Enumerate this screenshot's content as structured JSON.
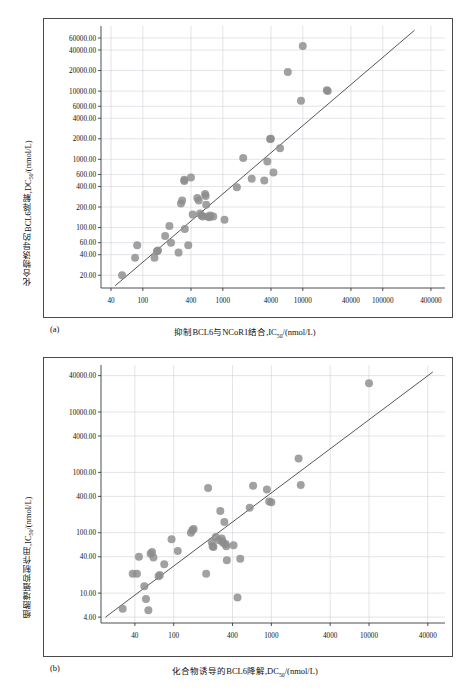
{
  "figure": {
    "panels": [
      {
        "tag": "(a)",
        "xlabel_pre": "抑制BCL6与NCoR1结合,IC",
        "xlabel_sub": "50",
        "xlabel_post": "/(nmol/L)",
        "ylabel_pre": "化合物诱导的BCL6降解,DC",
        "ylabel_sub": "50",
        "ylabel_post": "/(nmol/L)"
      },
      {
        "tag": "(b)",
        "xlabel_pre": "化合物诱导的BCL6降解,DC",
        "xlabel_sub": "50",
        "xlabel_post": "/(nmol/L)",
        "ylabel_pre": "细胞增殖抑制作用,IC",
        "ylabel_sub": "50",
        "ylabel_post": "/(nmol/L)"
      }
    ]
  },
  "chart_data": [
    {
      "type": "scatter",
      "title": "",
      "panel": "(a)",
      "xlabel": "抑制BCL6与NCoR1结合,IC50/(nmol/L)",
      "ylabel": "化合物诱导的BCL6降解,DC50/(nmol/L)",
      "xscale": "log",
      "yscale": "log",
      "xlim": [
        30,
        600000
      ],
      "ylim": [
        13,
        90000
      ],
      "grid": true,
      "legend": "none",
      "xticks": [
        40,
        100,
        400,
        1000,
        4000,
        10000,
        40000,
        100000,
        400000
      ],
      "xticklabels": [
        "40",
        "100",
        "400",
        "1000",
        "4000",
        "10000",
        "40000",
        "100000",
        "400000"
      ],
      "yticks": [
        20,
        40,
        60,
        100,
        200,
        400,
        600,
        1000,
        2000,
        4000,
        6000,
        10000,
        20000,
        40000,
        60000
      ],
      "yticklabels": [
        "20.00",
        "40.00",
        "60.00",
        "100.00",
        "200.00",
        "400.00",
        "600.00",
        "1000.00",
        "2000.00",
        "4000.00",
        "6000.00",
        "10000.00",
        "20000.00",
        "40000.00",
        "60000.00"
      ],
      "marker_color": "#8c8c8c",
      "trendline": {
        "x": [
          45,
          250000
        ],
        "y": [
          14,
          78000
        ]
      },
      "points": [
        [
          55,
          20
        ],
        [
          85,
          55
        ],
        [
          80,
          36
        ],
        [
          140,
          36
        ],
        [
          150,
          45
        ],
        [
          155,
          46
        ],
        [
          190,
          75
        ],
        [
          215,
          105
        ],
        [
          225,
          60
        ],
        [
          280,
          43
        ],
        [
          300,
          225
        ],
        [
          310,
          250
        ],
        [
          330,
          500
        ],
        [
          330,
          480
        ],
        [
          335,
          95
        ],
        [
          370,
          55
        ],
        [
          400,
          540
        ],
        [
          420,
          155
        ],
        [
          480,
          270
        ],
        [
          500,
          250
        ],
        [
          520,
          160
        ],
        [
          540,
          150
        ],
        [
          560,
          145
        ],
        [
          600,
          310
        ],
        [
          610,
          290
        ],
        [
          620,
          215
        ],
        [
          640,
          145
        ],
        [
          680,
          142
        ],
        [
          700,
          150
        ],
        [
          760,
          145
        ],
        [
          1050,
          130
        ],
        [
          1500,
          390
        ],
        [
          1800,
          1050
        ],
        [
          2300,
          520
        ],
        [
          3300,
          490
        ],
        [
          3600,
          930
        ],
        [
          3900,
          1980
        ],
        [
          4000,
          2000
        ],
        [
          4300,
          640
        ],
        [
          5200,
          1450
        ],
        [
          6500,
          19000
        ],
        [
          9500,
          7200
        ],
        [
          10000,
          46000
        ],
        [
          20000,
          10300
        ],
        [
          20500,
          10000
        ]
      ]
    },
    {
      "type": "scatter",
      "title": "",
      "panel": "(b)",
      "xlabel": "化合物诱导的BCL6降解,DC50/(nmol/L)",
      "ylabel": "细胞增殖抑制作用,IC50/(nmol/L)",
      "xscale": "log",
      "yscale": "log",
      "xlim": [
        18,
        60000
      ],
      "ylim": [
        3.2,
        60000
      ],
      "grid": true,
      "legend": "none",
      "xticks": [
        40,
        100,
        400,
        1000,
        4000,
        10000,
        40000
      ],
      "xticklabels": [
        "40",
        "100",
        "400",
        "1000",
        "4000",
        "10000",
        "40000"
      ],
      "yticks": [
        4,
        10,
        40,
        100,
        400,
        1000,
        4000,
        10000,
        40000
      ],
      "yticklabels": [
        "4.00",
        "10.00",
        "40.00",
        "100.00",
        "400.00",
        "1000.00",
        "4000.00",
        "10000.00",
        "40000.00"
      ],
      "marker_color": "#8c8c8c",
      "trendline": {
        "x": [
          20,
          45000
        ],
        "y": [
          4.0,
          46000
        ]
      },
      "points": [
        [
          30,
          5.5
        ],
        [
          38,
          21
        ],
        [
          42,
          21
        ],
        [
          44,
          40
        ],
        [
          50,
          13
        ],
        [
          52,
          8.0
        ],
        [
          55,
          5.2
        ],
        [
          58,
          45
        ],
        [
          60,
          48
        ],
        [
          62,
          39
        ],
        [
          70,
          19
        ],
        [
          72,
          20
        ],
        [
          80,
          30
        ],
        [
          95,
          78
        ],
        [
          110,
          50
        ],
        [
          150,
          100
        ],
        [
          155,
          110
        ],
        [
          160,
          115
        ],
        [
          215,
          21
        ],
        [
          225,
          550
        ],
        [
          245,
          70
        ],
        [
          250,
          60
        ],
        [
          255,
          58
        ],
        [
          270,
          85
        ],
        [
          290,
          75
        ],
        [
          300,
          230
        ],
        [
          310,
          80
        ],
        [
          315,
          72
        ],
        [
          320,
          68
        ],
        [
          330,
          150
        ],
        [
          340,
          65
        ],
        [
          345,
          60
        ],
        [
          350,
          35
        ],
        [
          410,
          62
        ],
        [
          450,
          8.5
        ],
        [
          480,
          37
        ],
        [
          600,
          260
        ],
        [
          650,
          600
        ],
        [
          900,
          520
        ],
        [
          950,
          330
        ],
        [
          1000,
          320
        ],
        [
          1900,
          1700
        ],
        [
          2000,
          620
        ],
        [
          10000,
          30000
        ]
      ]
    }
  ]
}
